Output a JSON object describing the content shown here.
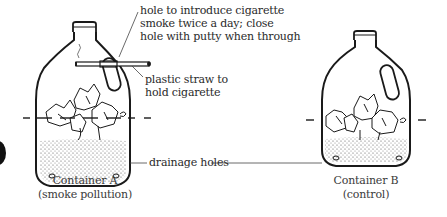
{
  "annotations": {
    "hole_line1": "hole to introduce cigarette",
    "hole_line2": "smoke twice a day; close",
    "hole_line3": "hole with putty when through",
    "straw_line1": "plastic straw to",
    "straw_line2": "hold cigarette",
    "drainage": "drainage holes"
  },
  "containers": [
    {
      "name": "Container A",
      "subtitle": "(smoke pollution)"
    },
    {
      "name": "Container B",
      "subtitle": "(control)"
    }
  ],
  "colors": {
    "ink": "#1a1a1a",
    "text": "#2a2a2a",
    "soil": "#9a9a9a"
  }
}
